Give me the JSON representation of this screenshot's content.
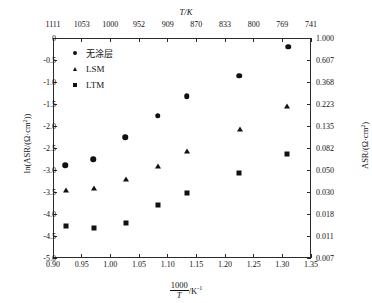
{
  "chart_data": {
    "type": "scatter",
    "title": "",
    "xlabel": "1000/T /K⁻¹",
    "ylabel": "ln(ASR/(Ω·cm²))",
    "ylabel_right": "ASR/(Ω·cm²)",
    "xlabel_top": "T/K",
    "xlim": [
      0.9,
      1.35
    ],
    "ylim": [
      -5.0,
      0.0
    ],
    "grid": false,
    "legend_position": "top-left",
    "xticks": [
      "0.90",
      "0.95",
      "1.00",
      "1.05",
      "1.10",
      "1.15",
      "1.20",
      "1.25",
      "1.30",
      "1.35"
    ],
    "xtick_values": [
      0.9,
      0.95,
      1.0,
      1.05,
      1.1,
      1.15,
      1.2,
      1.25,
      1.3,
      1.35
    ],
    "xticks_top": [
      "1111",
      "1053",
      "1000",
      "952",
      "909",
      "870",
      "833",
      "800",
      "769",
      "741"
    ],
    "xtick_top_values": [
      0.9,
      0.95,
      1.0,
      1.05,
      1.1,
      1.15,
      1.2,
      1.25,
      1.3,
      1.35
    ],
    "yticks": [
      "0",
      "-0.5",
      "-1.0",
      "-1.5",
      "-2.0",
      "-2.5",
      "-3.0",
      "-3.5",
      "-4.0",
      "-4.5",
      "-5.0"
    ],
    "ytick_values": [
      0,
      -0.5,
      -1.0,
      -1.5,
      -2.0,
      -2.5,
      -3.0,
      -3.5,
      -4.0,
      -4.5,
      -5.0
    ],
    "yticks_right": [
      "1.000",
      "0.607",
      "0.368",
      "0.223",
      "0.135",
      "0.082",
      "0.050",
      "0.030",
      "0.018",
      "0.011",
      "0.007"
    ],
    "ytick_right_values": [
      0,
      -0.5,
      -1.0,
      -1.5,
      -2.0,
      -2.5,
      -3.0,
      -3.5,
      -4.0,
      -4.5,
      -5.0
    ],
    "series": [
      {
        "name": "无涂层",
        "marker": "circle",
        "color": "#111111",
        "points": [
          {
            "x": 0.921,
            "y": -2.89
          },
          {
            "x": 0.97,
            "y": -2.75
          },
          {
            "x": 1.026,
            "y": -2.25
          },
          {
            "x": 1.083,
            "y": -1.77
          },
          {
            "x": 1.133,
            "y": -1.32
          },
          {
            "x": 1.225,
            "y": -0.86
          },
          {
            "x": 1.31,
            "y": -0.2
          }
        ]
      },
      {
        "name": "LSM",
        "marker": "triangle",
        "color": "#111111",
        "points": [
          {
            "x": 0.923,
            "y": -3.45
          },
          {
            "x": 0.972,
            "y": -3.41
          },
          {
            "x": 1.027,
            "y": -3.2
          },
          {
            "x": 1.083,
            "y": -2.91
          },
          {
            "x": 1.133,
            "y": -2.57
          },
          {
            "x": 1.227,
            "y": -2.07
          },
          {
            "x": 1.309,
            "y": -1.55
          }
        ]
      },
      {
        "name": "LTM",
        "marker": "square",
        "color": "#111111",
        "points": [
          {
            "x": 0.923,
            "y": -4.27
          },
          {
            "x": 0.972,
            "y": -4.32
          },
          {
            "x": 1.027,
            "y": -4.2
          },
          {
            "x": 1.083,
            "y": -3.8
          },
          {
            "x": 1.133,
            "y": -3.52
          },
          {
            "x": 1.225,
            "y": -3.07
          },
          {
            "x": 1.309,
            "y": -2.64
          }
        ]
      }
    ]
  },
  "legend": {
    "items": [
      {
        "label": "无涂层",
        "marker": "circle"
      },
      {
        "label": "LSM",
        "marker": "triangle"
      },
      {
        "label": "LTM",
        "marker": "square"
      }
    ]
  },
  "labels": {
    "top_axis_title": "T/K",
    "left_axis_title_pre": "ln(ASR/(Ω·cm",
    "left_axis_title_sup": "2",
    "left_axis_title_post": "))",
    "right_axis_title_pre": "ASR/(Ω·cm",
    "right_axis_title_sup": "2",
    "right_axis_title_post": ")",
    "x_axis_numerator": "1000",
    "x_axis_denominator": "T",
    "x_axis_unit_pre": "/K",
    "x_axis_unit_sup": "-1"
  }
}
